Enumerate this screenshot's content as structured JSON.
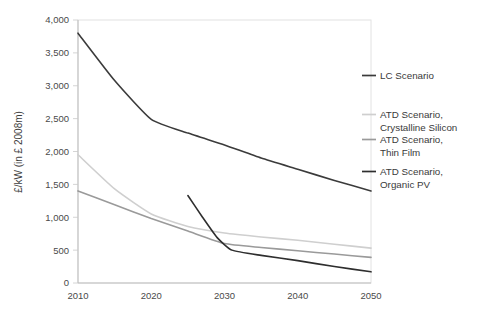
{
  "chart_data": {
    "type": "line",
    "title": "",
    "xlabel": "",
    "ylabel": "£/kW (in £ 2008m)",
    "xlim": [
      2010,
      2050
    ],
    "ylim": [
      0,
      4000
    ],
    "grid": false,
    "legend_position": "right",
    "x_ticks": [
      "2010",
      "2020",
      "2030",
      "2040",
      "2050"
    ],
    "x_tick_values": [
      2010,
      2020,
      2030,
      2040,
      2050
    ],
    "y_ticks": [
      "0",
      "500",
      "1,000",
      "1,500",
      "2,000",
      "2,500",
      "3,000",
      "3,500",
      "4,000"
    ],
    "y_tick_values": [
      0,
      500,
      1000,
      1500,
      2000,
      2500,
      3000,
      3500,
      4000
    ],
    "series": [
      {
        "name": "LC Scenario",
        "color": "#3b3b3b",
        "x": [
          2010,
          2015,
          2020,
          2025,
          2030,
          2035,
          2040,
          2045,
          2050
        ],
        "values": [
          3800,
          3080,
          2490,
          2280,
          2100,
          1900,
          1730,
          1560,
          1400
        ]
      },
      {
        "name": "ATD Scenario, Crystalline Silicon",
        "color": "#cfcfcf",
        "x": [
          2010,
          2015,
          2020,
          2025,
          2030,
          2035,
          2040,
          2045,
          2050
        ],
        "values": [
          1950,
          1430,
          1050,
          860,
          760,
          700,
          650,
          590,
          530
        ]
      },
      {
        "name": "ATD Scenario, Thin Film",
        "color": "#9a9a9a",
        "x": [
          2010,
          2015,
          2020,
          2025,
          2030,
          2035,
          2040,
          2045,
          2050
        ],
        "values": [
          1400,
          1190,
          980,
          790,
          600,
          540,
          490,
          440,
          390
        ]
      },
      {
        "name": "ATD Scenario, Organic PV",
        "color": "#2e2e2e",
        "x": [
          2025,
          2027,
          2029,
          2031,
          2035,
          2040,
          2045,
          2050
        ],
        "values": [
          1330,
          1000,
          690,
          500,
          420,
          340,
          250,
          170
        ]
      }
    ]
  },
  "legend": {
    "entries": [
      {
        "label": "LC Scenario",
        "label_line2": ""
      },
      {
        "label": "ATD Scenario,",
        "label_line2": "Crystalline Silicon"
      },
      {
        "label": "ATD Scenario,",
        "label_line2": "Thin Film"
      },
      {
        "label": "ATD Scenario,",
        "label_line2": "Organic PV"
      }
    ]
  }
}
